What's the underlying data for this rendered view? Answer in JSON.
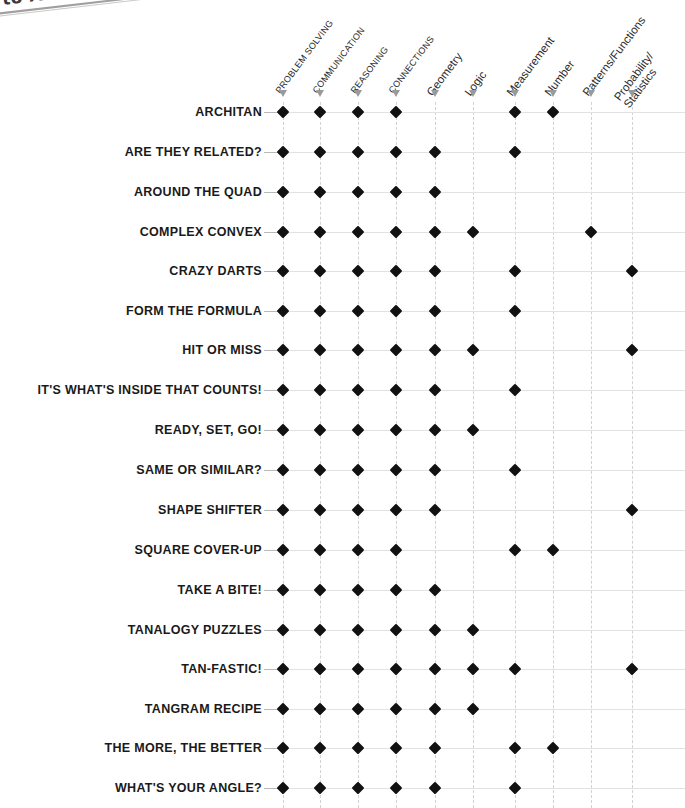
{
  "scan": {
    "fragment_text": "to A"
  },
  "chart_data": {
    "type": "table",
    "title": "",
    "xlabel": "",
    "ylabel": "",
    "legend": [],
    "grid": true,
    "columns": [
      "PROBLEM SOLVING",
      "COMMUNICATION",
      "REASONING",
      "CONNECTIONS",
      "Geometry",
      "Logic",
      "Measurement",
      "Number",
      "Patterns/Functions",
      "Probability/ Statistics"
    ],
    "column_styles": [
      "caps",
      "caps",
      "caps",
      "caps",
      "mixed",
      "mixed",
      "mixed",
      "mixed",
      "mixed",
      "twoline"
    ],
    "column_lines": [
      [
        "PROBLEM SOLVING"
      ],
      [
        "COMMUNICATION"
      ],
      [
        "REASONING"
      ],
      [
        "CONNECTIONS"
      ],
      [
        "Geometry"
      ],
      [
        "Logic"
      ],
      [
        "Measurement"
      ],
      [
        "Number"
      ],
      [
        "Patterns/Functions"
      ],
      [
        "Probability/",
        "Statistics"
      ]
    ],
    "categories": [
      "ARCHITAN",
      "ARE THEY RELATED?",
      "AROUND THE QUAD",
      "COMPLEX CONVEX",
      "CRAZY DARTS",
      "FORM THE FORMULA",
      "HIT OR MISS",
      "IT'S WHAT'S INSIDE THAT COUNTS!",
      "READY, SET, GO!",
      "SAME OR SIMILAR?",
      "SHAPE SHIFTER",
      "SQUARE COVER-UP",
      "TAKE A BITE!",
      "TANALOGY PUZZLES",
      "TAN-FASTIC!",
      "TANGRAM RECIPE",
      "THE MORE, THE BETTER",
      "WHAT'S YOUR ANGLE?"
    ],
    "marker": "diamond",
    "marker_color": "#111111",
    "values": [
      [
        1,
        1,
        1,
        1,
        0,
        0,
        1,
        1,
        0,
        0
      ],
      [
        1,
        1,
        1,
        1,
        1,
        0,
        1,
        0,
        0,
        0
      ],
      [
        1,
        1,
        1,
        1,
        1,
        0,
        0,
        0,
        0,
        0
      ],
      [
        1,
        1,
        1,
        1,
        1,
        1,
        0,
        0,
        1,
        0
      ],
      [
        1,
        1,
        1,
        1,
        1,
        0,
        1,
        0,
        0,
        1
      ],
      [
        1,
        1,
        1,
        1,
        1,
        0,
        1,
        0,
        0,
        0
      ],
      [
        1,
        1,
        1,
        1,
        1,
        1,
        0,
        0,
        0,
        1
      ],
      [
        1,
        1,
        1,
        1,
        1,
        0,
        1,
        0,
        0,
        0
      ],
      [
        1,
        1,
        1,
        1,
        1,
        1,
        0,
        0,
        0,
        0
      ],
      [
        1,
        1,
        1,
        1,
        1,
        0,
        1,
        0,
        0,
        0
      ],
      [
        1,
        1,
        1,
        1,
        1,
        0,
        0,
        0,
        0,
        1
      ],
      [
        1,
        1,
        1,
        1,
        0,
        0,
        1,
        1,
        0,
        0
      ],
      [
        1,
        1,
        1,
        1,
        1,
        0,
        0,
        0,
        0,
        0
      ],
      [
        1,
        1,
        1,
        1,
        1,
        1,
        0,
        0,
        0,
        0
      ],
      [
        1,
        1,
        1,
        1,
        1,
        1,
        1,
        0,
        0,
        1
      ],
      [
        1,
        1,
        1,
        1,
        1,
        1,
        0,
        0,
        0,
        0
      ],
      [
        1,
        1,
        1,
        1,
        1,
        0,
        1,
        1,
        0,
        0
      ],
      [
        1,
        1,
        1,
        1,
        1,
        0,
        1,
        0,
        0,
        0
      ]
    ],
    "column_x": [
      283,
      320,
      358,
      396,
      435,
      473,
      515,
      553,
      591,
      632
    ],
    "row_y": [
      112,
      152,
      192,
      232,
      271,
      311,
      350,
      390,
      430,
      470,
      510,
      550,
      590,
      630,
      669,
      709,
      748,
      788
    ],
    "label_right_x": 262,
    "header_baseline_y": 92
  }
}
